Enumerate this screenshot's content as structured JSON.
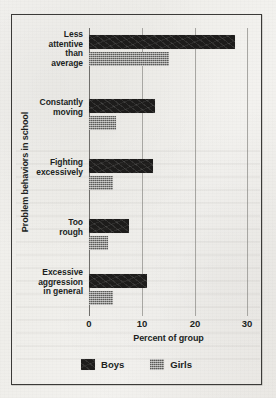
{
  "chart_data": {
    "type": "bar",
    "orientation": "horizontal",
    "title": "",
    "xlabel": "Percent of group",
    "ylabel": "Problem behaviors in school",
    "xlim": [
      0,
      30
    ],
    "xticks": [
      0,
      10,
      20,
      30
    ],
    "xtick_labels": [
      "0",
      "10",
      "20",
      "30"
    ],
    "grid": "vertical",
    "legend_position": "bottom-center",
    "categories": [
      "Less\nattentive\nthan\naverage",
      "Constantly\nmoving",
      "Fighting\nexcessively",
      "Too\nrough",
      "Excessive\naggression\nin general"
    ],
    "series": [
      {
        "name": "Boys",
        "color": "#1d1c1b",
        "values": [
          27.5,
          12.5,
          12.0,
          7.5,
          11.0
        ]
      },
      {
        "name": "Girls",
        "color": "#8d8d8a",
        "values": [
          15.0,
          5.0,
          4.5,
          3.5,
          4.5
        ]
      }
    ]
  },
  "legend": {
    "items": [
      {
        "label": "Boys",
        "swatch": "black-square-swatch"
      },
      {
        "label": "Girls",
        "swatch": "grey-square-swatch"
      }
    ]
  },
  "axes": {
    "x_title": "Percent of group",
    "y_title": "Problem behaviors in school",
    "x_tick_0": "0",
    "x_tick_1": "10",
    "x_tick_2": "20",
    "x_tick_3": "30"
  },
  "colors": {
    "boys": "#1d1c1b",
    "girls": "#8d8d8a",
    "frame": "#3b3a38",
    "gridline": "#a7a6a2",
    "paper": "#f2f1ed",
    "text": "#201f1e"
  }
}
